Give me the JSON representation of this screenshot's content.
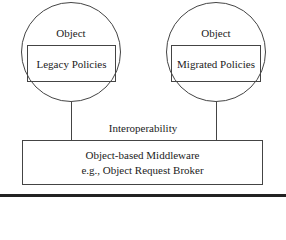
{
  "diagram": {
    "left_object": {
      "title": "Object",
      "inner_box": "Legacy Policies"
    },
    "right_object": {
      "title": "Object",
      "inner_box": "Migrated Policies"
    },
    "connector_label": "Interoperability",
    "middleware_box": {
      "line1": "Object-based Middleware",
      "line2": "e.g., Object Request Broker"
    }
  }
}
